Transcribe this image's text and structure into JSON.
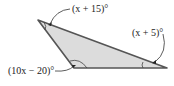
{
  "diagram": {
    "type": "triangle",
    "fill": "#d9d9d9",
    "stroke": "#555555",
    "angles": [
      {
        "vertex": "top-left",
        "label": "(x + 15)°"
      },
      {
        "vertex": "right",
        "label": "(x + 5)°"
      },
      {
        "vertex": "bottom-left",
        "label": "(10x − 20)°"
      }
    ]
  }
}
